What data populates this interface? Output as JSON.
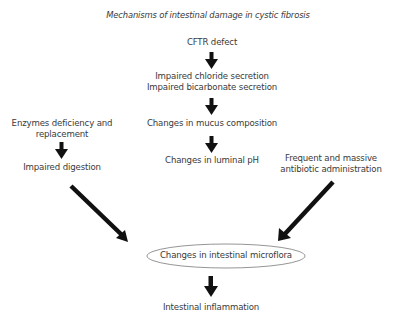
{
  "diagram": {
    "title": "Mechanisms of intestinal damage in cystic fibrosis",
    "nodes": {
      "cftr": "CFTR defect",
      "chloride": "Impaired chloride secretion",
      "bicarbonate": "Impaired bicarbonate secretion",
      "mucus": "Changes in mucus composition",
      "ph": "Changes in luminal pH",
      "enzymes_line1": "Enzymes deficiency and",
      "enzymes_line2": "replacement",
      "digestion": "Impaired digestion",
      "antibiotic_line1": "Frequent and massive",
      "antibiotic_line2": "antibiotic administration",
      "microflora": "Changes in intestinal microflora",
      "inflammation": "Intestinal inflammation"
    },
    "edges": [
      {
        "from": "CFTR defect",
        "to": "Impaired chloride/bicarbonate secretion"
      },
      {
        "from": "Impaired chloride/bicarbonate secretion",
        "to": "Changes in mucus composition"
      },
      {
        "from": "Changes in mucus composition",
        "to": "Changes in luminal pH"
      },
      {
        "from": "Enzymes deficiency and replacement",
        "to": "Impaired digestion"
      },
      {
        "from": "Impaired digestion",
        "to": "Changes in intestinal microflora"
      },
      {
        "from": "Frequent and massive antibiotic administration",
        "to": "Changes in intestinal microflora"
      },
      {
        "from": "Changes in intestinal microflora",
        "to": "Intestinal inflammation"
      }
    ],
    "colors": {
      "arrow": "#111111",
      "text": "#3a3a3a",
      "ellipse_stroke": "#777777"
    }
  }
}
